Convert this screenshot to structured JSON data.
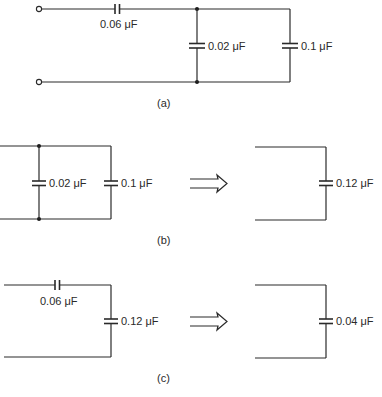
{
  "figure": {
    "panels": [
      {
        "id": "a",
        "caption": "(a)",
        "description": "Series capacitor feeding two parallel capacitors",
        "components": {
          "series_cap": {
            "label": "0.06 μF",
            "value_uF": 0.06
          },
          "shunt_cap_1": {
            "label": "0.02 μF",
            "value_uF": 0.02
          },
          "shunt_cap_2": {
            "label": "0.1 μF",
            "value_uF": 0.1
          }
        },
        "terminals": 2
      },
      {
        "id": "b",
        "caption": "(b)",
        "description": "Parallel capacitors combine",
        "left": {
          "cap_1": {
            "label": "0.02 μF",
            "value_uF": 0.02
          },
          "cap_2": {
            "label": "0.1 μF",
            "value_uF": 0.1
          }
        },
        "arrow": "double-arrow-right",
        "right": {
          "cap": {
            "label": "0.12 μF",
            "value_uF": 0.12
          }
        }
      },
      {
        "id": "c",
        "caption": "(c)",
        "description": "Series capacitors combine",
        "left": {
          "series_cap": {
            "label": "0.06 μF",
            "value_uF": 0.06
          },
          "shunt_cap": {
            "label": "0.12 μF",
            "value_uF": 0.12
          }
        },
        "arrow": "double-arrow-right",
        "right": {
          "cap": {
            "label": "0.04 μF",
            "value_uF": 0.04
          }
        }
      }
    ],
    "colors": {
      "ink": "#2a2a2a",
      "background": "#ffffff"
    }
  }
}
